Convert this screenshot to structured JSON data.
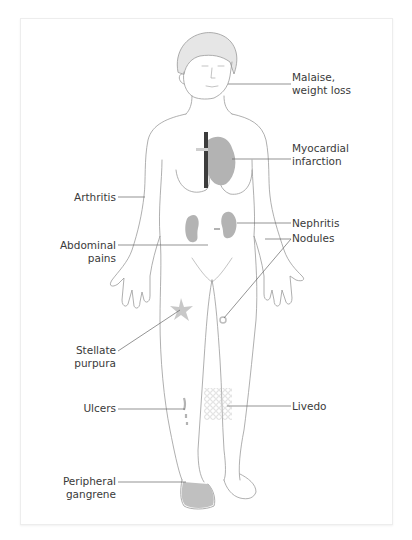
{
  "figure": {
    "colors": {
      "outline": "#9a9a9a",
      "organ_fill": "#b3b3b3",
      "aorta": "#3c3c3c",
      "leader_line": "#666666",
      "text": "#3a3a3a",
      "card_border": "#ededed"
    }
  },
  "labels": {
    "malaise": {
      "line1": "Malaise,",
      "line2": "weight loss"
    },
    "myocardial": {
      "line1": "Myocardial",
      "line2": "infarction"
    },
    "arthritis": {
      "line1": "Arthritis"
    },
    "nephritis": {
      "line1": "Nephritis"
    },
    "nodules": {
      "line1": "Nodules"
    },
    "abdominal": {
      "line1": "Abdominal",
      "line2": "pains"
    },
    "stellate": {
      "line1": "Stellate",
      "line2": "purpura"
    },
    "ulcers": {
      "line1": "Ulcers"
    },
    "livedo": {
      "line1": "Livedo"
    },
    "gangrene": {
      "line1": "Peripheral",
      "line2": "gangrene"
    }
  }
}
